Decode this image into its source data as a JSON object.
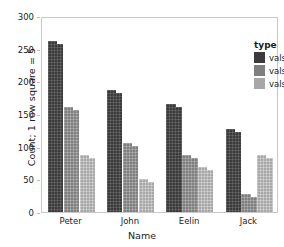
{
  "chart_data": {
    "type": "bar",
    "title": "",
    "xlabel": "Name",
    "ylabel": "Count; 1 row square = 5",
    "categories": [
      "Peter",
      "John",
      "Eelin",
      "Jack"
    ],
    "series": [
      {
        "name": "vals1",
        "color": "#3b3b3b",
        "values": [
          262,
          186,
          166,
          127
        ]
      },
      {
        "name": "vals2",
        "color": "#7f7f7f",
        "values": [
          161,
          106,
          87,
          27
        ]
      },
      {
        "name": "vals3",
        "color": "#a7a7a7",
        "values": [
          88,
          51,
          69,
          87
        ]
      }
    ],
    "ylim": [
      0,
      300
    ],
    "yticks": [
      0,
      50,
      100,
      150,
      200,
      250,
      300
    ],
    "ytick_labels": [
      "0",
      "50",
      "100",
      "150",
      "200",
      "250",
      "300"
    ],
    "grid": false,
    "legend": {
      "title": "type",
      "position": "top-right",
      "entries": [
        "vals1",
        "vals2",
        "vals3"
      ]
    }
  }
}
